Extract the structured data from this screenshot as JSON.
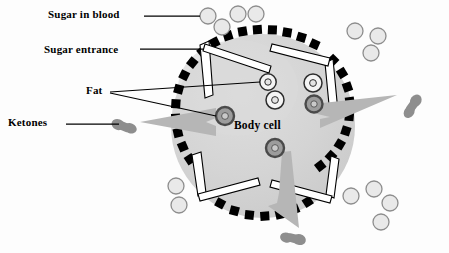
{
  "diagram": {
    "center_label": "Body cell",
    "labels": [
      {
        "id": "sugar-in-blood",
        "text": "Sugar in blood"
      },
      {
        "id": "sugar-entrance",
        "text": "Sugar entrance"
      },
      {
        "id": "fat",
        "text": "Fat"
      },
      {
        "id": "ketones",
        "text": "Ketones"
      }
    ],
    "colors": {
      "cell_fill": "#d2d2d2",
      "cell_fill_light": "#dcdcdc",
      "membrane": "#000000",
      "sugar_fill": "#e8e8e8",
      "sugar_stroke": "#8a8a8a",
      "fat_dark_fill": "#9a9a9a",
      "fat_dark_stroke": "#4a4a4a",
      "fat_light_fill": "#f2f2f2",
      "fat_light_stroke": "#333333",
      "ketone_fill": "#8e8e8e",
      "arrow_fill": "#b4b4b4",
      "gate_fill": "#ffffff",
      "gate_stroke": "#000000",
      "leader_line": "#000000",
      "text": "#000000"
    },
    "cell": {
      "cx": 263,
      "cy": 126,
      "r": 92
    },
    "counts": {
      "sugar_outside": 11,
      "sugar_entrances": 4,
      "fat_particles_light": 3,
      "fat_particles_dark": 3,
      "ketones_released": 3,
      "export_arrows": 3
    },
    "sugar_outside": [
      {
        "cx": 208,
        "cy": 16,
        "r": 8
      },
      {
        "cx": 222,
        "cy": 27,
        "r": 8
      },
      {
        "cx": 238,
        "cy": 14,
        "r": 8
      },
      {
        "cx": 256,
        "cy": 14,
        "r": 8
      },
      {
        "cx": 355,
        "cy": 31,
        "r": 8
      },
      {
        "cx": 378,
        "cy": 36,
        "r": 8
      },
      {
        "cx": 371,
        "cy": 53,
        "r": 8
      },
      {
        "cx": 176,
        "cy": 186,
        "r": 8
      },
      {
        "cx": 179,
        "cy": 205,
        "r": 8
      },
      {
        "cx": 351,
        "cy": 196,
        "r": 8
      },
      {
        "cx": 374,
        "cy": 189,
        "r": 8
      },
      {
        "cx": 390,
        "cy": 203,
        "r": 8
      },
      {
        "cx": 381,
        "cy": 222,
        "r": 8
      }
    ],
    "fat_light": [
      {
        "cx": 268,
        "cy": 82,
        "r": 8
      },
      {
        "cx": 275,
        "cy": 100,
        "r": 9
      },
      {
        "cx": 313,
        "cy": 83,
        "r": 9
      }
    ],
    "fat_dark": [
      {
        "cx": 225,
        "cy": 116,
        "r": 9
      },
      {
        "cx": 314,
        "cy": 104,
        "r": 8
      },
      {
        "cx": 275,
        "cy": 148,
        "r": 9
      }
    ],
    "ketones": [
      {
        "x": 124,
        "y": 127,
        "angle": -70
      },
      {
        "x": 411,
        "y": 106,
        "angle": 35
      },
      {
        "x": 293,
        "y": 237,
        "angle": 15
      }
    ]
  }
}
